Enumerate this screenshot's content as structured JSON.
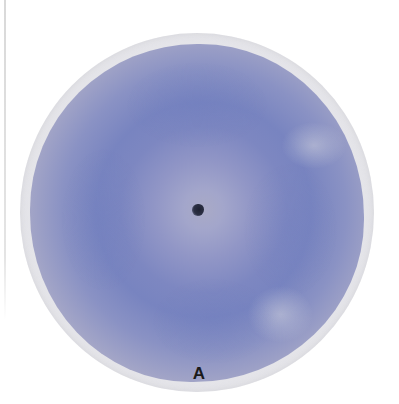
{
  "image": {
    "subject": "circular filter paper with blue radial stain pattern",
    "label": "A",
    "colors": {
      "background": "#ffffff",
      "paper_edge": "#e9e9ec",
      "stain_outer": "#c2bcc8",
      "stain_blue": "#7884c0",
      "stain_center": "#a9aac6",
      "center_hole": "#1f2233"
    }
  }
}
